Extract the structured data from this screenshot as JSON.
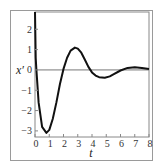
{
  "chart_data": {
    "type": "line",
    "title": "",
    "xlabel": "t",
    "ylabel": "x′",
    "xlim": [
      0,
      8
    ],
    "ylim": [
      -3.3,
      2.85
    ],
    "xticks": [
      0,
      1,
      2,
      3,
      4,
      5,
      6,
      7,
      8
    ],
    "yticks": [
      -3,
      -2,
      -1,
      0,
      1,
      2
    ],
    "grid": false,
    "legend": null,
    "zero_line": true,
    "series": [
      {
        "name": "x′(t)",
        "color": "#111111",
        "x": [
          0,
          0.05,
          0.1,
          0.25,
          0.5,
          0.8,
          1.0,
          1.25,
          1.5,
          1.75,
          2.0,
          2.25,
          2.5,
          2.8,
          3.0,
          3.25,
          3.5,
          3.75,
          4.0,
          4.25,
          4.5,
          4.9,
          5.25,
          5.5,
          6.0,
          6.5,
          7.0,
          7.5,
          8.0
        ],
        "y": [
          2.85,
          0.6,
          0.0,
          -1.6,
          -2.8,
          -3.1,
          -2.95,
          -2.4,
          -1.6,
          -0.7,
          0.05,
          0.6,
          0.95,
          1.1,
          1.05,
          0.85,
          0.5,
          0.15,
          -0.12,
          -0.28,
          -0.36,
          -0.38,
          -0.32,
          -0.22,
          -0.03,
          0.1,
          0.13,
          0.1,
          0.04
        ]
      }
    ]
  }
}
